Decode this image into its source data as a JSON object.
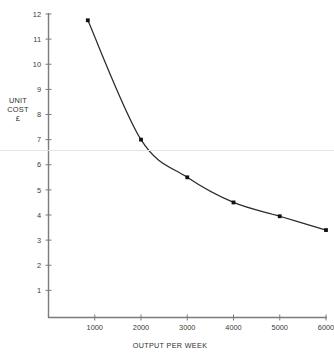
{
  "chart_data": {
    "type": "line",
    "title": "",
    "xlabel": "OUTPUT PER WEEK",
    "ylabel": "UNIT COST £",
    "ylabel_lines": [
      "UNIT",
      "COST",
      "£"
    ],
    "x": [
      850,
      2000,
      3000,
      4000,
      5000,
      6000
    ],
    "values": [
      11.75,
      7.0,
      5.5,
      4.5,
      3.95,
      3.4
    ],
    "series": [
      {
        "name": "Unit cost",
        "x": [
          850,
          2000,
          3000,
          4000,
          5000,
          6000
        ],
        "values": [
          11.75,
          7.0,
          5.5,
          4.5,
          3.95,
          3.4
        ]
      }
    ],
    "xlim": [
      0,
      6000
    ],
    "ylim": [
      0,
      12
    ],
    "xticks": [
      1000,
      2000,
      3000,
      4000,
      5000,
      6000
    ],
    "xtick_labels": [
      "1000",
      "2000",
      "3000",
      "4000",
      "5000",
      "6000"
    ],
    "yticks": [
      1,
      2,
      3,
      4,
      5,
      6,
      7,
      8,
      9,
      10,
      11,
      12
    ],
    "ytick_labels": [
      "1",
      "2",
      "3",
      "4",
      "5",
      "6",
      "7",
      "8",
      "9",
      "10",
      "11",
      "12"
    ],
    "grid": false,
    "legend": false,
    "marker": "square",
    "line_color": "#2b2b2b",
    "marker_color": "#111111",
    "axis_color": "#7b7b7b",
    "background": "#ffffff"
  },
  "artifacts": {
    "fold_line_color": "#e3e3e3"
  }
}
